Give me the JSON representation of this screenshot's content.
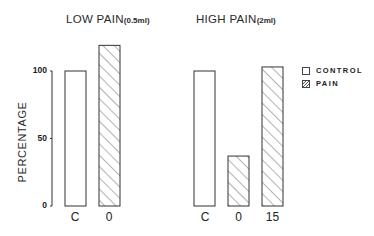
{
  "chart_data": {
    "type": "bar",
    "ylabel": "PERCENTAGE",
    "ylim": [
      0,
      100
    ],
    "yticks": [
      "100",
      "50",
      "0"
    ],
    "grid": false,
    "legend_position": "right",
    "legend": [
      {
        "label": "CONTROL",
        "style": "open"
      },
      {
        "label": "PAIN",
        "style": "hatched"
      }
    ],
    "panels": [
      {
        "title": "LOW PAIN",
        "title_sub": "(0.5ml)",
        "categories": [
          "C",
          "0"
        ],
        "values": [
          100,
          119
        ],
        "styles": [
          "open",
          "hatched"
        ]
      },
      {
        "title": "HIGH PAIN",
        "title_sub": "(2ml)",
        "categories": [
          "C",
          "0",
          "15"
        ],
        "values": [
          100,
          37,
          103
        ],
        "styles": [
          "open",
          "hatched",
          "hatched"
        ]
      }
    ]
  }
}
